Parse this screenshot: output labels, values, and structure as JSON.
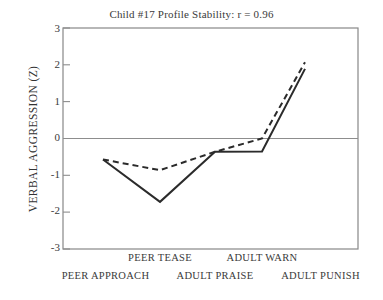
{
  "chart_data": {
    "type": "line",
    "title": "Child #17 Profile Stability: r = 0.96",
    "xlabel": "",
    "ylabel": "VERBAL AGGRESSION (Z)",
    "ylim": [
      -3,
      3
    ],
    "yticks": [
      "3",
      "2",
      "1",
      "0",
      "-1",
      "-2",
      "-3"
    ],
    "ytick_values": [
      3,
      2,
      1,
      0,
      -1,
      -2,
      -3
    ],
    "grid": false,
    "zero_line": true,
    "legend": "none",
    "categories": [
      "PEER APPROACH",
      "PEER TEASE",
      "ADULT PRAISE",
      "ADULT WARN",
      "ADULT PUNISH"
    ],
    "category_rows": [
      {
        "row": "upper",
        "labels": [
          "PEER TEASE",
          "ADULT WARN"
        ]
      },
      {
        "row": "lower",
        "labels": [
          "PEER APPROACH",
          "ADULT PRAISE",
          "ADULT PUNISH"
        ]
      }
    ],
    "series": [
      {
        "name": "Time 1",
        "style": "solid",
        "color": "#2b2b2b",
        "values": [
          -0.57,
          -1.72,
          -0.36,
          -0.35,
          1.89
        ]
      },
      {
        "name": "Time 2",
        "style": "dashed",
        "color": "#2b2b2b",
        "values": [
          -0.57,
          -0.86,
          -0.36,
          0.0,
          2.07
        ]
      }
    ],
    "correlation_r": "0.96",
    "child_id": "#17"
  },
  "axis": {
    "frame_color": "#888888",
    "zero_line_color": "#8d8d8d"
  }
}
